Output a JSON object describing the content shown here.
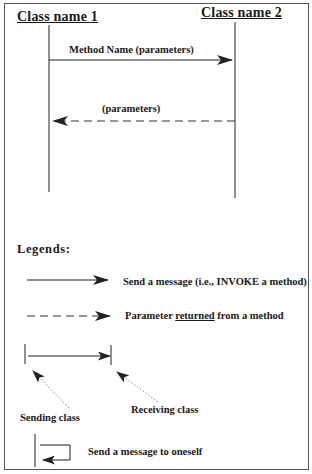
{
  "diagram": {
    "type": "uml-sequence-diagram-legend",
    "lifelines": [
      {
        "id": "class1",
        "label": "Class name 1"
      },
      {
        "id": "class2",
        "label": "Class name 2"
      }
    ],
    "messages": [
      {
        "from": "class1",
        "to": "class2",
        "style": "solid",
        "label": "Method Name (parameters)"
      },
      {
        "from": "class2",
        "to": "class1",
        "style": "dashed",
        "label": "(parameters)"
      }
    ]
  },
  "legend": {
    "title": "Legends:",
    "items": [
      {
        "symbol": "solid-arrow",
        "label": "Send a message (i.e., INVOKE a method)"
      },
      {
        "symbol": "dashed-arrow",
        "label_pre": "Parameter ",
        "label_emph": "returned",
        "label_post": " from a method"
      },
      {
        "symbol": "sender-receiver",
        "sending_label": "Sending class",
        "receiving_label": "Receiving class"
      },
      {
        "symbol": "self-message",
        "label": "Send a message to oneself"
      }
    ]
  },
  "colors": {
    "line": "#222222",
    "dotted": "#888888",
    "frame": "#555555"
  }
}
